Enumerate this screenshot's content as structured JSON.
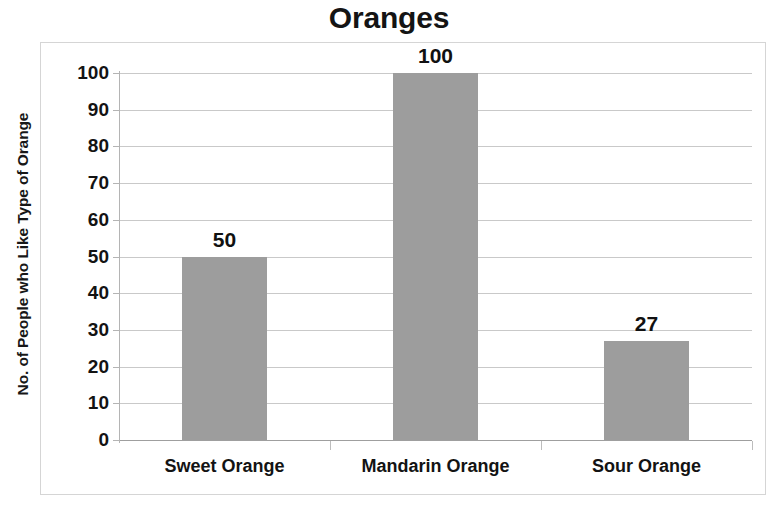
{
  "chart_data": {
    "type": "bar",
    "title": "Oranges",
    "xlabel": "",
    "ylabel": "No. of People who Like Type of Orange",
    "categories": [
      "Sweet Orange",
      "Mandarin Orange",
      "Sour Orange"
    ],
    "values": [
      50,
      100,
      27
    ],
    "value_labels": [
      "50",
      "100",
      "27"
    ],
    "ylim": [
      0,
      100
    ],
    "ytick_step": 10,
    "yticks": [
      100,
      90,
      80,
      70,
      60,
      50,
      40,
      30,
      20,
      10,
      0
    ],
    "ytick_labels": [
      "100",
      "90",
      "80",
      "70",
      "60",
      "50",
      "40",
      "30",
      "20",
      "10",
      "0"
    ],
    "grid": true,
    "grid_axis": "y",
    "legend": false,
    "legend_position": "none",
    "bar_color": "#9d9d9d",
    "gridline_color": "#c9c9c9",
    "axis_color": "#b4b4b4",
    "text_color": "#131313",
    "background_color": "#ffffff",
    "series": [
      {
        "name": "No. of People who Like Type of Orange",
        "values": [
          50,
          100,
          27
        ]
      }
    ]
  }
}
